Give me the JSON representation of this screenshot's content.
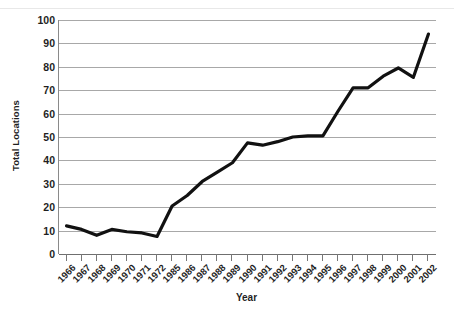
{
  "chart_data": {
    "type": "line",
    "title": "",
    "xlabel": "Year",
    "ylabel": "Total Locations",
    "categories": [
      "1966",
      "1967",
      "1968",
      "1969",
      "1970",
      "1971",
      "1972",
      "1985",
      "1986",
      "1987",
      "1988",
      "1989",
      "1990",
      "1991",
      "1992",
      "1993",
      "1994",
      "1995",
      "1996",
      "1997",
      "1998",
      "1999",
      "2000",
      "2001",
      "2002"
    ],
    "values": [
      12,
      10.5,
      8,
      10.5,
      9.5,
      9,
      7.5,
      20.5,
      25,
      31,
      35,
      39,
      47.5,
      46.5,
      48,
      50,
      50.5,
      50.5,
      61,
      71,
      71,
      76,
      79.5,
      75.5,
      94
    ],
    "series": [
      {
        "name": "Total Locations",
        "values": [
          12,
          10.5,
          8,
          10.5,
          9.5,
          9,
          7.5,
          20.5,
          25,
          31,
          35,
          39,
          47.5,
          46.5,
          48,
          50,
          50.5,
          50.5,
          61,
          71,
          71,
          76,
          79.5,
          75.5,
          94
        ]
      }
    ],
    "ylim": [
      0,
      100
    ],
    "y_ticks": [
      0,
      10,
      20,
      30,
      40,
      50,
      60,
      70,
      80,
      90,
      100
    ],
    "y_tick_labels": [
      "0",
      "10",
      "20",
      "30",
      "40",
      "50",
      "60",
      "70",
      "80",
      "90",
      "100"
    ],
    "grid": true,
    "grid_axis": "y",
    "legend": false,
    "legend_position": "none",
    "line_color": "#111111",
    "line_width": 3.2,
    "markers": false,
    "grid_color": "#a8a8a8",
    "axis_color": "#6f6f6f",
    "background_color": "#ffffff",
    "text_color": "#1f1f1f"
  },
  "axes": {
    "y_title": "Total Locations",
    "x_title": "Year"
  }
}
